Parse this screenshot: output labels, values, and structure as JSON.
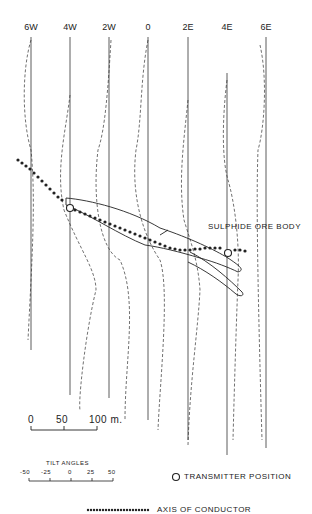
{
  "stations": [
    {
      "label": "6W",
      "x": 31
    },
    {
      "label": "4W",
      "x": 70
    },
    {
      "label": "2W",
      "x": 109
    },
    {
      "label": "0",
      "x": 148
    },
    {
      "label": "2E",
      "x": 188
    },
    {
      "label": "4E",
      "x": 227
    },
    {
      "label": "6E",
      "x": 266
    }
  ],
  "ore_body_label": "SULPHIDE ORE BODY",
  "scale_bar": {
    "ticks": [
      "0",
      "50",
      "100 m."
    ]
  },
  "tilt_angles": {
    "title": "TILT ANGLES",
    "ticks": [
      "-50",
      "-25",
      "0",
      "25",
      "50"
    ]
  },
  "legend": {
    "transmitter": "TRANSMITTER POSITION",
    "axis": "AXIS OF CONDUCTOR"
  },
  "colors": {
    "ink": "#222222",
    "background": "#ffffff"
  }
}
